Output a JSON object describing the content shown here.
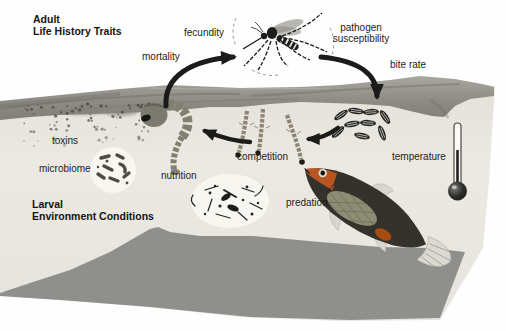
{
  "diagram": {
    "type": "mosquito-life-cycle-diagram",
    "titles": {
      "adult": {
        "line1": "Adult",
        "line2": "Life History Traits"
      },
      "larval": {
        "line1": "Larval",
        "line2": "Environment Conditions"
      }
    },
    "adult_trait_labels": {
      "fecundity": "fecundity",
      "mortality": "mortality",
      "pathogen_line1": "pathogen",
      "pathogen_line2": "susceptibility",
      "bite_rate": "bite rate"
    },
    "larval_condition_labels": {
      "toxins": "toxins",
      "microbiome": "microbiome",
      "nutrition": "nutrition",
      "competition": "competition",
      "predation": "predation",
      "temperature": "temperature"
    },
    "illustrations": [
      "adult-mosquito",
      "mosquito-eggs",
      "mosquito-larvae",
      "mosquito-pupa",
      "predator-fish",
      "thermometer",
      "microbiome-bacteria",
      "nutrition-detritus",
      "toxin-particles",
      "water-surface",
      "sediment"
    ],
    "colors": {
      "background": "#ffffff",
      "water": "#e9e7e0",
      "surface_band": "#92908a",
      "sediment": "#8f8f8c",
      "arrow": "#1b1b19",
      "organism": "#80806f",
      "fish_body": "#33322c",
      "fish_accent": "#c05722",
      "text": "#1d1d1c"
    }
  }
}
